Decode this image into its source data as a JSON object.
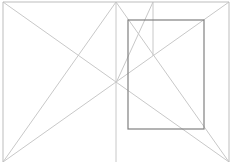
{
  "diagram": {
    "type": "van-de-graaf-canon",
    "width": 236,
    "height": 162,
    "colors": {
      "background": "#ffffff",
      "guide_line": "#c8c8c8",
      "page_border": "#bdbdbd",
      "text_block": "#808080"
    },
    "spread": {
      "left": 3,
      "top": 2,
      "right": 229,
      "bottom": 162,
      "spine_x": 116
    },
    "guides": [
      {
        "name": "left-page-diagonal",
        "x1": 3,
        "y1": 2,
        "x2": 229,
        "y2": 162
      },
      {
        "name": "right-page-diagonal",
        "x1": 229,
        "y1": 2,
        "x2": 3,
        "y2": 162
      },
      {
        "name": "left-page-single-diagonal",
        "x1": 116,
        "y1": 2,
        "x2": 3,
        "y2": 162
      },
      {
        "name": "right-page-single-diagonal",
        "x1": 116,
        "y1": 2,
        "x2": 229,
        "y2": 162
      },
      {
        "name": "spine-to-top-vertical-link",
        "x1": 116,
        "y1": 83,
        "x2": 153,
        "y2": 2
      },
      {
        "name": "third-vertical",
        "x1": 153,
        "y1": 2,
        "x2": 153,
        "y2": 56
      },
      {
        "name": "spine",
        "x1": 116,
        "y1": 2,
        "x2": 116,
        "y2": 162
      }
    ],
    "text_block": {
      "x": 128,
      "y": 20,
      "width": 76,
      "height": 109
    }
  }
}
